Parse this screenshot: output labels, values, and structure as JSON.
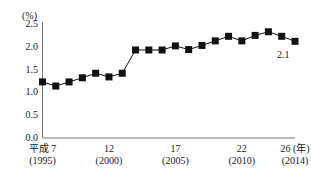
{
  "chart_data": {
    "type": "line",
    "title": "",
    "subtitle": "",
    "xlabel": "",
    "ylabel": "",
    "unit_label": "(%)",
    "grid": false,
    "legend": null,
    "ylim": [
      0.0,
      2.5
    ],
    "xlim": [
      1995,
      2014
    ],
    "y_ticks": [
      "2.5",
      "2.0",
      "1.5",
      "1.0",
      "0.5",
      "0.0"
    ],
    "y_tick_values": [
      2.5,
      2.0,
      1.5,
      1.0,
      0.5,
      0.0
    ],
    "x_tick_labels": [
      {
        "era": "平成 7",
        "year": "(1995)",
        "value": 1995
      },
      {
        "era": "12",
        "year": "(2000)",
        "value": 2000
      },
      {
        "era": "17",
        "year": "(2005)",
        "value": 2005
      },
      {
        "era": "22",
        "year": "(2010)",
        "value": 2010
      },
      {
        "era": "26 (年)",
        "year": "(2014)",
        "value": 2014
      }
    ],
    "x": [
      1995,
      1996,
      1997,
      1998,
      1999,
      2000,
      2001,
      2002,
      2003,
      2004,
      2005,
      2006,
      2007,
      2008,
      2009,
      2010,
      2011,
      2012,
      2013,
      2014
    ],
    "values": [
      1.23,
      1.14,
      1.23,
      1.32,
      1.42,
      1.34,
      1.42,
      1.93,
      1.93,
      1.93,
      2.02,
      1.94,
      2.03,
      2.13,
      2.23,
      2.13,
      2.25,
      2.33,
      2.23,
      2.12
    ],
    "annotations": [
      {
        "label": "2.1",
        "x": 2014,
        "y": 2.12
      }
    ],
    "marker": {
      "shape": "square",
      "color": "#111111",
      "size": 7
    },
    "line": {
      "color": "#111111",
      "width": 1
    }
  }
}
